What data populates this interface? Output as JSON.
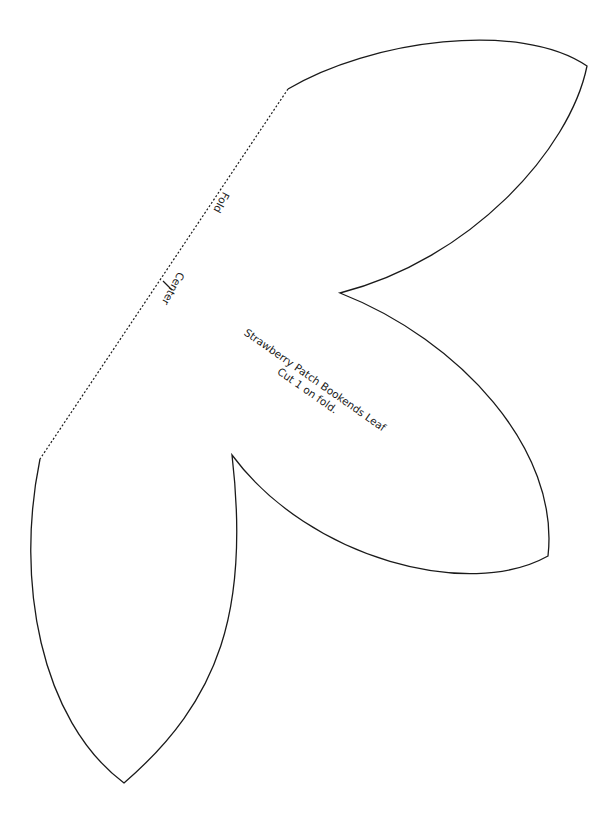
{
  "pattern": {
    "title": "Strawberry Patch Bookends Leaf",
    "instruction": "Cut 1 on fold.",
    "fold_label": "Fold",
    "center_label": "Center"
  },
  "colors": {
    "outline": "#1a1a1a",
    "background": "#ffffff"
  }
}
